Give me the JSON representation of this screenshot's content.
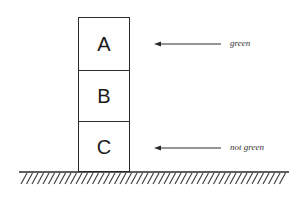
{
  "diagram": {
    "type": "blocks-world",
    "blocks": [
      {
        "id": "A",
        "label": "A",
        "position": "top"
      },
      {
        "id": "B",
        "label": "B",
        "position": "middle"
      },
      {
        "id": "C",
        "label": "C",
        "position": "bottom"
      }
    ],
    "annotations": [
      {
        "target": "A",
        "text": "green",
        "icon": "arrow-left-icon"
      },
      {
        "target": "C",
        "text": "not green",
        "icon": "arrow-left-icon"
      }
    ],
    "ground": {
      "icon": "hatched-ground-icon"
    },
    "colors": {
      "stroke": "#2a2a2a",
      "text": "#1a1a1a",
      "annotation_text": "#333333",
      "background": "#ffffff"
    }
  }
}
